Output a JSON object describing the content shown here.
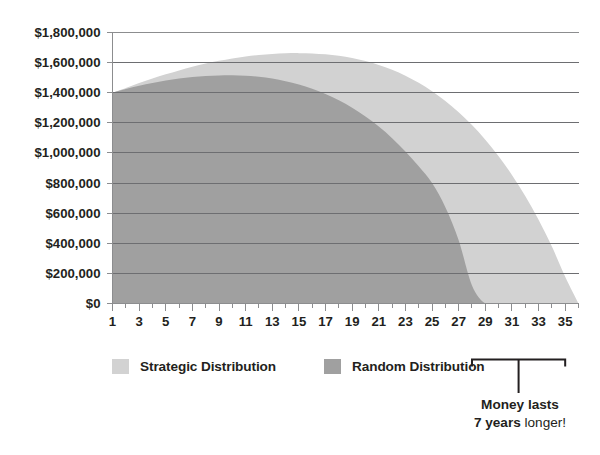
{
  "chart_data": {
    "type": "area",
    "title": "",
    "xlabel": "",
    "ylabel": "",
    "grid": true,
    "legend_position": "bottom-left",
    "xlim": [
      1,
      36
    ],
    "ylim": [
      0,
      1800000
    ],
    "y_tick_labels": [
      "$1,800,000",
      "$1,600,000",
      "$1,400,000",
      "$1,200,000",
      "$1,000,000",
      "$800,000",
      "$600,000",
      "$400,000",
      "$200,000",
      "$0"
    ],
    "y_tick_values": [
      1800000,
      1600000,
      1400000,
      1200000,
      1000000,
      800000,
      600000,
      400000,
      200000,
      0
    ],
    "x_tick_labels": [
      "1",
      "3",
      "5",
      "7",
      "9",
      "11",
      "13",
      "15",
      "17",
      "19",
      "21",
      "23",
      "25",
      "27",
      "29",
      "31",
      "33",
      "35"
    ],
    "x_tick_values": [
      1,
      3,
      5,
      7,
      9,
      11,
      13,
      15,
      17,
      19,
      21,
      23,
      25,
      27,
      29,
      31,
      33,
      35
    ],
    "x": [
      1,
      2,
      3,
      4,
      5,
      6,
      7,
      8,
      9,
      10,
      11,
      12,
      13,
      14,
      15,
      16,
      17,
      18,
      19,
      20,
      21,
      22,
      23,
      24,
      25,
      26,
      27,
      28,
      29,
      30,
      31,
      32,
      33,
      34,
      35,
      36
    ],
    "series": [
      {
        "name": "Strategic Distribution",
        "color": "#d2d2d2",
        "values": [
          1400000,
          1432000,
          1464000,
          1494000,
          1522000,
          1548000,
          1572000,
          1594000,
          1612000,
          1628000,
          1641000,
          1651000,
          1658000,
          1662000,
          1663000,
          1661000,
          1655000,
          1645000,
          1630000,
          1610000,
          1584000,
          1552000,
          1513000,
          1466000,
          1410000,
          1345000,
          1270000,
          1185000,
          1088000,
          978000,
          854000,
          714000,
          556000,
          378000,
          178000,
          0
        ]
      },
      {
        "name": "Random Distribution",
        "color": "#a0a0a0",
        "values": [
          1400000,
          1424000,
          1446000,
          1465000,
          1481000,
          1494000,
          1504000,
          1511000,
          1515000,
          1516000,
          1513000,
          1506000,
          1494000,
          1477000,
          1455000,
          1427000,
          1392000,
          1350000,
          1300000,
          1242000,
          1175000,
          1098000,
          1010000,
          911000,
          800000,
          640000,
          420000,
          120000,
          0,
          0,
          0,
          0,
          0,
          0,
          0,
          0
        ]
      }
    ],
    "annotations": [
      {
        "type": "bracket",
        "from_x": 28,
        "to_x": 35,
        "label_line_1": "Money lasts",
        "label_emphasis": "7 years",
        "label_suffix": " longer!"
      }
    ]
  },
  "legend": {
    "items": [
      {
        "label": "Strategic Distribution",
        "color": "#d2d2d2"
      },
      {
        "label": "Random Distribution",
        "color": "#a0a0a0"
      }
    ]
  },
  "annotation": {
    "line1": "Money lasts",
    "emphasis": "7 years",
    "suffix": " longer!"
  },
  "colors": {
    "strategic": "#d2d2d2",
    "random": "#a0a0a0",
    "gridline": "#6d6e71",
    "axis": "#8c8d8f",
    "text": "#231f20",
    "background": "#ffffff"
  }
}
